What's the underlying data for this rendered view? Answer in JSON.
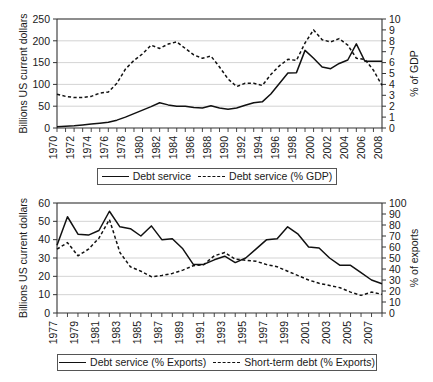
{
  "chart_data": [
    {
      "id": "top",
      "type": "line",
      "title": "",
      "xlabel": "",
      "ylabel": "Billions US current dollars",
      "y2label": "% of GDP",
      "ylim": [
        0,
        250
      ],
      "y2lim": [
        0,
        10
      ],
      "yticks": [
        0,
        50,
        100,
        150,
        200,
        250
      ],
      "y2ticks": [
        0,
        1,
        2,
        3,
        4,
        5,
        6,
        7,
        8,
        9,
        10
      ],
      "grid": true,
      "xlim": [
        1970,
        2008
      ],
      "x": [
        1970,
        1971,
        1972,
        1973,
        1974,
        1975,
        1976,
        1977,
        1978,
        1979,
        1980,
        1981,
        1982,
        1983,
        1984,
        1985,
        1986,
        1987,
        1988,
        1989,
        1990,
        1991,
        1992,
        1993,
        1994,
        1995,
        1996,
        1997,
        1998,
        1999,
        2000,
        2001,
        2002,
        2003,
        2004,
        2005,
        2006,
        2007,
        2008
      ],
      "xtick_labels": [
        "1970",
        "1972",
        "1974",
        "1976",
        "1978",
        "1980",
        "1982",
        "1984",
        "1986",
        "1988",
        "1990",
        "1992",
        "1994",
        "1996",
        "1998",
        "2000",
        "2002",
        "2004",
        "2006",
        "2008"
      ],
      "xtick_values": [
        1970,
        1972,
        1974,
        1976,
        1978,
        1980,
        1982,
        1984,
        1986,
        1988,
        1990,
        1992,
        1994,
        1996,
        1998,
        2000,
        2002,
        2004,
        2006,
        2008
      ],
      "series": [
        {
          "name": "Debt service",
          "axis": "left",
          "style": "solid",
          "values": [
            3,
            4,
            5,
            7,
            9,
            11,
            13,
            18,
            25,
            33,
            41,
            49,
            58,
            53,
            50,
            50,
            47,
            46,
            51,
            46,
            43,
            46,
            52,
            58,
            60,
            78,
            102,
            126,
            127,
            178,
            160,
            140,
            136,
            148,
            156,
            193,
            153,
            153,
            153
          ]
        },
        {
          "name": "Debt service (% GDP)",
          "axis": "right",
          "style": "dashed",
          "values": [
            3.1,
            2.9,
            2.8,
            2.8,
            2.9,
            3.2,
            3.3,
            4.1,
            5.4,
            6.2,
            6.8,
            7.6,
            7.3,
            7.7,
            7.9,
            7.3,
            6.7,
            6.4,
            6.6,
            5.6,
            4.5,
            3.8,
            4.1,
            4.1,
            3.9,
            4.9,
            5.7,
            6.3,
            6.2,
            7.8,
            9.0,
            8.1,
            7.9,
            8.2,
            7.6,
            6.4,
            6.3,
            5.3,
            3.9
          ]
        }
      ],
      "legend": {
        "position": "bottom",
        "entries": [
          {
            "label": "Debt service",
            "style": "solid"
          },
          {
            "label": "Debt service (% GDP)",
            "style": "dashed"
          }
        ]
      }
    },
    {
      "id": "bottom",
      "type": "line",
      "title": "",
      "xlabel": "",
      "ylabel": "Billions US current dollars",
      "y2label": "% of exports",
      "ylim": [
        0,
        60
      ],
      "y2lim": [
        0,
        100
      ],
      "yticks": [
        0,
        10,
        20,
        30,
        40,
        50,
        60
      ],
      "y2ticks": [
        0,
        10,
        20,
        30,
        40,
        50,
        60,
        70,
        80,
        90,
        100
      ],
      "grid": true,
      "xlim": [
        1977,
        2008
      ],
      "x": [
        1977,
        1978,
        1979,
        1980,
        1981,
        1982,
        1983,
        1984,
        1985,
        1986,
        1987,
        1988,
        1989,
        1990,
        1991,
        1992,
        1993,
        1994,
        1995,
        1996,
        1997,
        1998,
        1999,
        2000,
        2001,
        2002,
        2003,
        2004,
        2005,
        2006,
        2007,
        2008
      ],
      "xtick_labels": [
        "1977",
        "1979",
        "1981",
        "1983",
        "1985",
        "1987",
        "1989",
        "1991",
        "1993",
        "1995",
        "1997",
        "1999",
        "2001",
        "2003",
        "2005",
        "2007"
      ],
      "xtick_values": [
        1977,
        1979,
        1981,
        1983,
        1985,
        1987,
        1989,
        1991,
        1993,
        1995,
        1997,
        1999,
        2001,
        2003,
        2005,
        2007
      ],
      "series": [
        {
          "name": "Debt service (% Exports)",
          "axis": "left",
          "style": "solid",
          "values": [
            37,
            52.5,
            43,
            42.5,
            45,
            55.5,
            47,
            46,
            42,
            47.5,
            40,
            40.5,
            35,
            26.5,
            26.5,
            29,
            31,
            27.5,
            30,
            35,
            40,
            40.5,
            47,
            43,
            36,
            35.5,
            30,
            26,
            26,
            22,
            18,
            16
          ]
        },
        {
          "name": "Short-term debt (% Exports)",
          "axis": "right",
          "style": "dashed",
          "values": [
            58,
            64,
            52,
            58,
            68,
            85,
            55,
            42,
            38,
            33,
            34,
            36,
            39,
            43,
            44,
            52,
            55,
            49,
            48,
            47,
            44,
            42,
            38,
            34,
            30,
            27,
            25,
            23,
            19,
            16,
            19,
            17
          ]
        }
      ],
      "legend": {
        "position": "bottom",
        "entries": [
          {
            "label": "Debt service (% Exports)",
            "style": "solid"
          },
          {
            "label": "Short-term debt (% Exports)",
            "style": "dashed"
          }
        ]
      }
    }
  ]
}
